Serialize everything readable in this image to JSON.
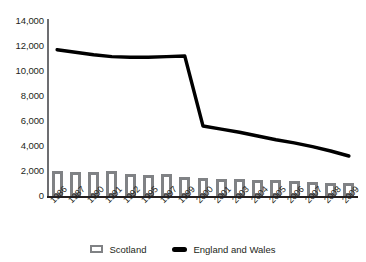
{
  "chart_data": {
    "type": "bar",
    "title": "",
    "subtitle": "",
    "xlabel": "",
    "ylabel": "",
    "ylim": [
      0,
      14000
    ],
    "ytick_values": [
      14000,
      12000,
      10000,
      8000,
      6000,
      4000,
      2000,
      0
    ],
    "ytick_labels": [
      "14,000",
      "12,000",
      "10,000",
      "8,000",
      "6,000",
      "4,000",
      "2,000",
      "0"
    ],
    "grid": false,
    "legend_position": "bottom",
    "categories": [
      "1986",
      "1987",
      "1990",
      "1991",
      "1992",
      "1995",
      "1997",
      "1999",
      "2000",
      "2001",
      "2003",
      "2004",
      "2005",
      "2006",
      "2007",
      "2008",
      "2009"
    ],
    "series": [
      {
        "name": "Scotland",
        "type": "bar",
        "color": "#808285",
        "values": [
          2000,
          1950,
          1950,
          1980,
          1800,
          1700,
          1800,
          1500,
          1420,
          1380,
          1350,
          1300,
          1250,
          1200,
          1120,
          1050,
          1080
        ]
      },
      {
        "name": "England and Wales",
        "type": "line",
        "color": "#000000",
        "values": [
          11700,
          11500,
          11300,
          11150,
          11100,
          11100,
          11150,
          11200,
          5600,
          5350,
          5100,
          4800,
          4500,
          4250,
          3950,
          3600,
          3200
        ]
      }
    ]
  },
  "legend": {
    "entries": [
      {
        "label": "Scotland",
        "marker": "bar-swatch",
        "color": "#808285"
      },
      {
        "label": "England and Wales",
        "marker": "line-swatch",
        "color": "#000000"
      }
    ]
  }
}
